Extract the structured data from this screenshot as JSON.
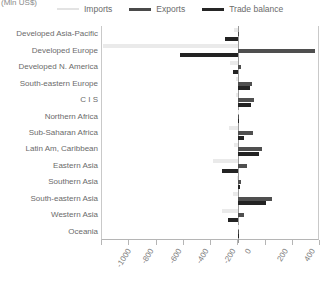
{
  "axis_unit": "(Mln US$)",
  "legend": {
    "position": "top",
    "items": [
      {
        "label": "Imports",
        "swatch": "imports",
        "color": "#eaeaea"
      },
      {
        "label": "Exports",
        "swatch": "exports",
        "color": "#4f4f4f"
      },
      {
        "label": "Trade balance",
        "swatch": "balance",
        "color": "#232323"
      }
    ]
  },
  "chart_data": {
    "type": "bar",
    "orientation": "horizontal",
    "title": "",
    "xlabel": "(Mln US$)",
    "ylabel": "",
    "xlim": [
      -1000,
      600
    ],
    "grid": false,
    "legend_position": "top",
    "ticks": [
      -1000,
      -800,
      -600,
      -400,
      -200,
      0,
      200,
      400,
      600
    ],
    "tick_labels": [
      "-1000",
      "-800",
      "-600",
      "-400",
      "-200",
      "0",
      "200",
      "400",
      "600"
    ],
    "categories": [
      "Developed Asia-Pacific",
      "Developed Europe",
      "Developed N. America",
      "South-eastern Europe",
      "C I S",
      "Northern Africa",
      "Sub-Saharan Africa",
      "Latin Am, Caribbean",
      "Eastern Asia",
      "Southern Asia",
      "South-eastern Asia",
      "Western Asia",
      "Oceania"
    ],
    "series": [
      {
        "name": "Imports",
        "color": "#eaeaea",
        "values": [
          -30,
          -990,
          -60,
          -15,
          -20,
          -5,
          -70,
          -30,
          -185,
          -10,
          -40,
          -120,
          -3
        ]
      },
      {
        "name": "Exports",
        "color": "#4f4f4f",
        "values": [
          5,
          565,
          20,
          100,
          115,
          5,
          110,
          175,
          65,
          20,
          245,
          45,
          3
        ]
      },
      {
        "name": "Trade balance",
        "color": "#232323",
        "values": [
          -95,
          -425,
          -40,
          85,
          95,
          2,
          45,
          150,
          -120,
          12,
          205,
          -75,
          0
        ]
      }
    ]
  }
}
